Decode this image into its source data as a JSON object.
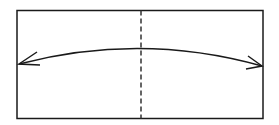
{
  "diagram": {
    "type": "fold-instruction",
    "elements": [
      {
        "kind": "rectangle",
        "role": "paper-sheet"
      },
      {
        "kind": "dashed-line",
        "role": "fold-line",
        "orientation": "vertical"
      },
      {
        "kind": "curved-arrow",
        "role": "fold-direction",
        "heads": "both"
      }
    ],
    "colors": {
      "stroke": "#1a1a1a",
      "background": "#ffffff"
    }
  }
}
